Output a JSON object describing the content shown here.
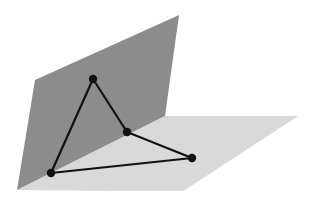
{
  "diagram": {
    "colors": {
      "background": "#ffffff",
      "vertical_plane": "#8c8c8c",
      "horizontal_plane": "#d9d9d9",
      "edge": "#111111",
      "vertex": "#111111"
    },
    "planes": [
      {
        "name": "vertical-plane",
        "points": [
          [
            35,
            80
          ],
          [
            179,
            15
          ],
          [
            165,
            116
          ],
          [
            17,
            190
          ]
        ]
      },
      {
        "name": "horizontal-plane",
        "points": [
          [
            155,
            116
          ],
          [
            298,
            116
          ],
          [
            183,
            191
          ],
          [
            17,
            190
          ]
        ]
      }
    ],
    "vertices": [
      {
        "name": "vertex-top",
        "x": 93,
        "y": 79
      },
      {
        "name": "vertex-fold",
        "x": 127,
        "y": 132
      },
      {
        "name": "vertex-right",
        "x": 192,
        "y": 158
      },
      {
        "name": "vertex-bottom-left",
        "x": 51,
        "y": 173
      }
    ],
    "edges": [
      [
        0,
        1
      ],
      [
        1,
        2
      ],
      [
        2,
        3
      ],
      [
        3,
        0
      ]
    ]
  }
}
